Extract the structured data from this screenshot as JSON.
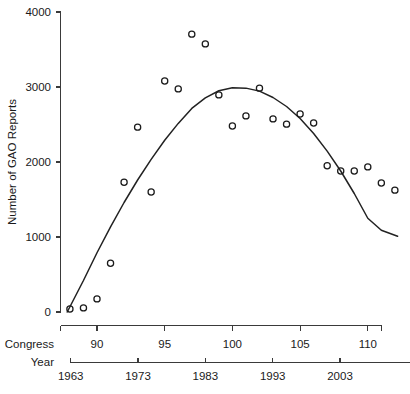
{
  "chart_data": {
    "type": "scatter",
    "title": "",
    "xlabel": "Congress",
    "ylabel": "Number of GAO Reports",
    "xlim": [
      87.2,
      112.4
    ],
    "ylim": [
      0,
      4000
    ],
    "grid": false,
    "legend": null,
    "x": [
      88,
      89,
      90,
      91,
      92,
      93,
      94,
      95,
      96,
      97,
      98,
      99,
      100,
      101,
      102,
      103,
      104,
      105,
      106,
      107,
      108,
      109,
      110,
      111,
      112
    ],
    "values": [
      40,
      55,
      175,
      650,
      1730,
      2465,
      1600,
      3080,
      2975,
      3705,
      3575,
      2895,
      2480,
      2615,
      2985,
      2575,
      2505,
      2640,
      2520,
      1950,
      1880,
      1880,
      1935,
      1720,
      1625
    ],
    "series": [
      {
        "name": "GAO reports per Congress",
        "marker": "open-circle",
        "values": [
          40,
          55,
          175,
          650,
          1730,
          2465,
          1600,
          3080,
          2975,
          3705,
          3575,
          2895,
          2480,
          2615,
          2985,
          2575,
          2505,
          2640,
          2520,
          1950,
          1880,
          1880,
          1935,
          1720,
          1625
        ]
      },
      {
        "name": "quadratic fit (LOESS/poly trend)",
        "type": "line",
        "x": [
          87.8,
          89,
          90,
          91,
          92,
          93,
          94,
          95,
          96,
          97,
          98,
          99,
          100,
          101,
          102,
          103,
          104,
          105,
          106,
          107,
          108,
          109,
          110,
          111,
          112.2
        ],
        "values": [
          0,
          420,
          790,
          1135,
          1460,
          1760,
          2035,
          2290,
          2515,
          2715,
          2855,
          2950,
          2990,
          2985,
          2945,
          2860,
          2740,
          2580,
          2380,
          2145,
          1880,
          1580,
          1250,
          1090,
          1010
        ]
      }
    ],
    "y_ticks": [
      0,
      1000,
      2000,
      3000,
      4000
    ],
    "y_tick_labels": [
      "0",
      "1000",
      "2000",
      "3000",
      "4000"
    ],
    "congress_ticks": [
      90,
      95,
      100,
      105,
      110
    ],
    "congress_tick_labels": [
      "90",
      "95",
      "100",
      "105",
      "110"
    ],
    "year_ticks": [
      1963,
      1973,
      1983,
      1993,
      2003
    ],
    "year_tick_labels": [
      "1963",
      "1973",
      "1983",
      "1993",
      "2003"
    ],
    "axis_row_labels": {
      "congress": "Congress",
      "year": "Year"
    }
  },
  "figure": {
    "y_axis_title": "Number of GAO Reports",
    "congress_row_label": "Congress",
    "year_row_label": "Year",
    "caption": ""
  }
}
